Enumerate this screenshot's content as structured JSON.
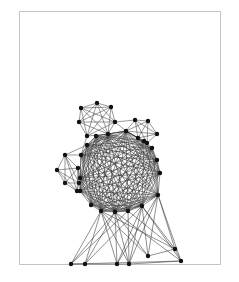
{
  "diagram": {
    "type": "network-graph",
    "frame": {
      "x": 19,
      "y": 11,
      "width": 202,
      "height": 254,
      "border_color": "#c4c4c4"
    },
    "node_color": "#111111",
    "edge_color": "#333333",
    "node_radius": 2.2,
    "clusters": {
      "top": [
        [
          97,
          103
        ],
        [
          81,
          108
        ],
        [
          111,
          107
        ],
        [
          79,
          122
        ],
        [
          115,
          122
        ],
        [
          87,
          136
        ],
        [
          108,
          134
        ]
      ],
      "right": [
        [
          135,
          120
        ],
        [
          148,
          121
        ],
        [
          157,
          134
        ],
        [
          126,
          131
        ],
        [
          138,
          138
        ],
        [
          147,
          143
        ]
      ],
      "left": [
        [
          65,
          155
        ],
        [
          57,
          170
        ],
        [
          65,
          183
        ],
        [
          78,
          168
        ],
        [
          79,
          183
        ],
        [
          77,
          191
        ]
      ],
      "core": [
        [
          96,
          136
        ],
        [
          108,
          134
        ],
        [
          126,
          131
        ],
        [
          144,
          141
        ],
        [
          152,
          148
        ],
        [
          157,
          160
        ],
        [
          160,
          173
        ],
        [
          158,
          195
        ],
        [
          142,
          206
        ],
        [
          128,
          211
        ],
        [
          115,
          212
        ],
        [
          101,
          211
        ],
        [
          91,
          205
        ],
        [
          80,
          191
        ],
        [
          80,
          178
        ],
        [
          81,
          155
        ],
        [
          87,
          145
        ]
      ],
      "bottom": [
        [
          71,
          264
        ],
        [
          85,
          264
        ],
        [
          117,
          264
        ],
        [
          129,
          264
        ],
        [
          148,
          256
        ],
        [
          175,
          249
        ],
        [
          181,
          261
        ]
      ]
    },
    "bottom_links": [
      [
        101,
        211,
        71,
        264
      ],
      [
        101,
        211,
        85,
        264
      ],
      [
        101,
        211,
        117,
        264
      ],
      [
        101,
        211,
        129,
        264
      ],
      [
        101,
        211,
        148,
        256
      ],
      [
        101,
        211,
        175,
        249
      ],
      [
        115,
        212,
        71,
        264
      ],
      [
        115,
        212,
        85,
        264
      ],
      [
        115,
        212,
        117,
        264
      ],
      [
        115,
        212,
        129,
        264
      ],
      [
        115,
        212,
        148,
        256
      ],
      [
        115,
        212,
        181,
        261
      ],
      [
        142,
        206,
        85,
        264
      ],
      [
        142,
        206,
        117,
        264
      ],
      [
        142,
        206,
        129,
        264
      ],
      [
        142,
        206,
        148,
        256
      ],
      [
        142,
        206,
        175,
        249
      ],
      [
        142,
        206,
        181,
        261
      ],
      [
        158,
        195,
        117,
        264
      ],
      [
        158,
        195,
        129,
        264
      ],
      [
        158,
        195,
        148,
        256
      ],
      [
        158,
        195,
        175,
        249
      ],
      [
        158,
        195,
        181,
        261
      ],
      [
        128,
        211,
        71,
        264
      ],
      [
        128,
        211,
        129,
        264
      ],
      [
        128,
        211,
        175,
        249
      ],
      [
        71,
        264,
        129,
        264
      ],
      [
        129,
        264,
        181,
        261
      ],
      [
        148,
        256,
        175,
        249
      ],
      [
        175,
        249,
        181,
        261
      ]
    ]
  }
}
